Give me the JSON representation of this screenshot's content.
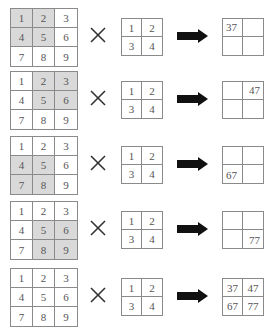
{
  "diagram": {
    "title": "",
    "operator_symbol": "×",
    "input_matrix": [
      [
        "1",
        "2",
        "3"
      ],
      [
        "4",
        "5",
        "6"
      ],
      [
        "7",
        "8",
        "9"
      ]
    ],
    "kernel_matrix": [
      [
        "1",
        "2"
      ],
      [
        "3",
        "4"
      ]
    ],
    "steps": [
      {
        "highlighted_cells": [
          [
            0,
            0
          ],
          [
            0,
            1
          ],
          [
            1,
            0
          ],
          [
            1,
            1
          ]
        ],
        "result": [
          [
            "37",
            ""
          ],
          [
            "",
            ""
          ]
        ]
      },
      {
        "highlighted_cells": [
          [
            0,
            1
          ],
          [
            0,
            2
          ],
          [
            1,
            1
          ],
          [
            1,
            2
          ]
        ],
        "result": [
          [
            "",
            "47"
          ],
          [
            "",
            ""
          ]
        ]
      },
      {
        "highlighted_cells": [
          [
            1,
            0
          ],
          [
            1,
            1
          ],
          [
            2,
            0
          ],
          [
            2,
            1
          ]
        ],
        "result": [
          [
            "",
            ""
          ],
          [
            "67",
            ""
          ]
        ]
      },
      {
        "highlighted_cells": [
          [
            1,
            1
          ],
          [
            1,
            2
          ],
          [
            2,
            1
          ],
          [
            2,
            2
          ]
        ],
        "result": [
          [
            "",
            ""
          ],
          [
            "",
            "77"
          ]
        ]
      },
      {
        "highlighted_cells": [],
        "result": [
          [
            "37",
            "47"
          ],
          [
            "67",
            "77"
          ]
        ]
      }
    ]
  },
  "rows": [
    {
      "input": [
        "1",
        "2",
        "3",
        "4",
        "5",
        "6",
        "7",
        "8",
        "9"
      ],
      "kernel": [
        "1",
        "2",
        "3",
        "4"
      ],
      "result": [
        "37",
        "",
        "",
        ""
      ]
    },
    {
      "input": [
        "1",
        "2",
        "3",
        "4",
        "5",
        "6",
        "7",
        "8",
        "9"
      ],
      "kernel": [
        "1",
        "2",
        "3",
        "4"
      ],
      "result": [
        "",
        "47",
        "",
        ""
      ]
    },
    {
      "input": [
        "1",
        "2",
        "3",
        "4",
        "5",
        "6",
        "7",
        "8",
        "9"
      ],
      "kernel": [
        "1",
        "2",
        "3",
        "4"
      ],
      "result": [
        "",
        "",
        "67",
        ""
      ]
    },
    {
      "input": [
        "1",
        "2",
        "3",
        "4",
        "5",
        "6",
        "7",
        "8",
        "9"
      ],
      "kernel": [
        "1",
        "2",
        "3",
        "4"
      ],
      "result": [
        "",
        "",
        "",
        "77"
      ]
    },
    {
      "input": [
        "1",
        "2",
        "3",
        "4",
        "5",
        "6",
        "7",
        "8",
        "9"
      ],
      "kernel": [
        "1",
        "2",
        "3",
        "4"
      ],
      "result": [
        "37",
        "47",
        "67",
        "77"
      ]
    }
  ],
  "colors": {
    "highlight": "#d9d9d9",
    "border": "#8a8a8a",
    "arrow": "#111111",
    "text": "#555555"
  }
}
